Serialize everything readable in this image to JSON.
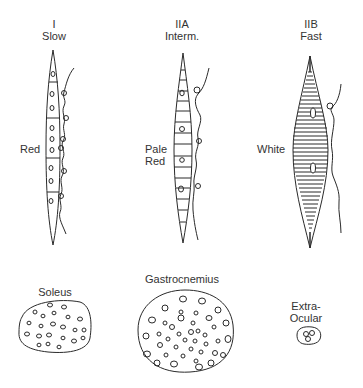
{
  "fiber_types": [
    {
      "type": "I",
      "speed": "Slow",
      "color_label": "Red"
    },
    {
      "type": "IIA",
      "speed": "Interm.",
      "color_label_line1": "Pale",
      "color_label_line2": "Red"
    },
    {
      "type": "IIB",
      "speed": "Fast",
      "color_label": "White"
    }
  ],
  "muscles": [
    {
      "name": "Soleus"
    },
    {
      "name": "Gastrocnemius"
    },
    {
      "name": "Extra-",
      "name_line2": "Ocular"
    }
  ],
  "colors": {
    "line": "#2a2a2a",
    "background": "#ffffff"
  }
}
